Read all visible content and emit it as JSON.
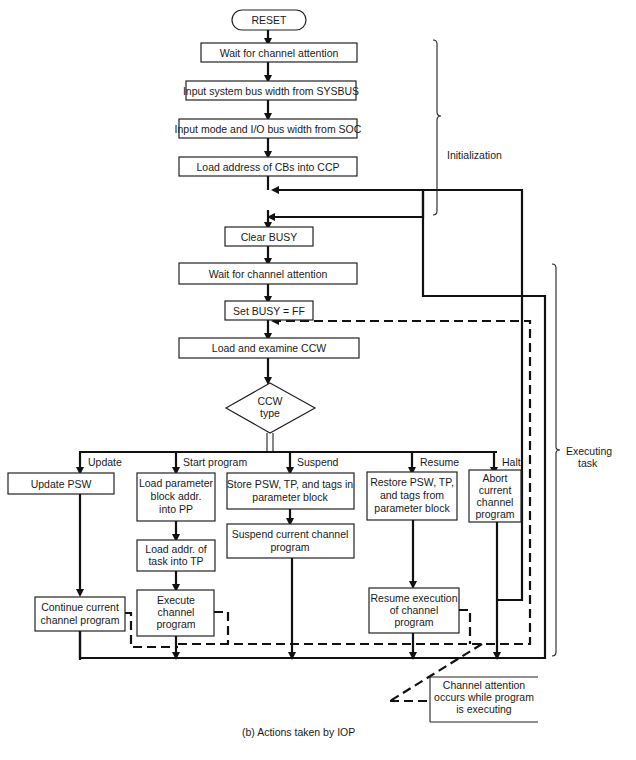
{
  "nodes": {
    "reset": "RESET",
    "wait1": "Wait for channel attention",
    "input_sysbus": "Input system bus width from SYSBUS",
    "input_mode": "Input mode and I/O bus width from SOC",
    "load_cbs": "Load address of CBs into CCP",
    "clear_busy": "Clear BUSY",
    "wait2": "Wait for channel attention",
    "set_busy": "Set BUSY = FF",
    "load_ccw": "Load and examine CCW",
    "decision": [
      "CCW",
      "type"
    ],
    "update_psw": "Update PSW",
    "load_param": [
      "Load parameter",
      "block addr.",
      "into PP"
    ],
    "load_addr": [
      "Load addr. of",
      "task into TP"
    ],
    "execute": [
      "Execute",
      "channel",
      "program"
    ],
    "continue": [
      "Continue current",
      "channel program"
    ],
    "store_psw": [
      "Store PSW, TP, and tags in",
      "parameter block"
    ],
    "suspend_prog": [
      "Suspend current channel",
      "program"
    ],
    "restore_psw": [
      "Restore PSW, TP,",
      "and tags from",
      "parameter block"
    ],
    "resume_exec": [
      "Resume execution",
      "of channel",
      "program"
    ],
    "abort": [
      "Abort",
      "current",
      "channel",
      "program"
    ]
  },
  "branches": {
    "update": "Update",
    "start": "Start program",
    "suspend": "Suspend",
    "resume": "Resume",
    "halt": "Halt"
  },
  "annotations": {
    "initialization": "Initialization",
    "executing": [
      "Executing",
      "task"
    ],
    "attention_note": [
      "Channel attention",
      "occurs while program",
      "is executing"
    ]
  },
  "caption": "(b)  Actions taken by IOP"
}
